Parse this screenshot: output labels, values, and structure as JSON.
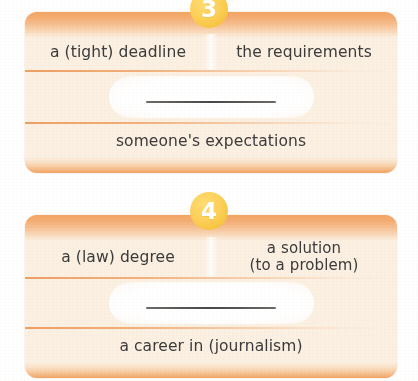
{
  "page": {
    "background_color": "#ffffff",
    "band_color": "#f2a665",
    "card_fill_color": "#fbf0e2",
    "badge_color": "#f6c33f",
    "text_color": "#3b3b3b"
  },
  "exercises": [
    {
      "number": "3",
      "badge_name": "exercise-number-3",
      "options": [
        {
          "label": "a (tight) deadline",
          "lines": [
            "a (tight) deadline"
          ]
        },
        {
          "label": "the requirements",
          "lines": [
            "the requirements"
          ]
        }
      ],
      "answer_blank": "",
      "footer": "someone's expectations"
    },
    {
      "number": "4",
      "badge_name": "exercise-number-4",
      "options": [
        {
          "label": "a (law) degree",
          "lines": [
            "a (law) degree"
          ]
        },
        {
          "label": "a solution (to a problem)",
          "lines": [
            "a solution",
            "(to a problem)"
          ]
        }
      ],
      "answer_blank": "",
      "footer": "a career in (journalism)"
    }
  ]
}
